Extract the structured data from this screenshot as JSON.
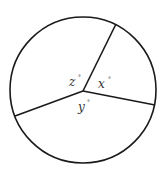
{
  "diagram": {
    "type": "circle-with-central-angles",
    "stroke_color": "#1a1a1a",
    "label_color": "#333333",
    "circle": {
      "cx": 83,
      "cy": 90,
      "r": 73
    },
    "vertex": {
      "x": 83,
      "y": 91
    },
    "rays": [
      {
        "name": "ray-upper-right",
        "x": 116,
        "y": 24
      },
      {
        "name": "ray-right",
        "x": 155,
        "y": 105
      },
      {
        "name": "ray-left",
        "x": 15,
        "y": 116
      }
    ],
    "angles": [
      {
        "name": "z",
        "label": "z",
        "degree_mark": "°"
      },
      {
        "name": "x",
        "label": "x",
        "degree_mark": "°"
      },
      {
        "name": "y",
        "label": "y",
        "degree_mark": "°"
      }
    ]
  }
}
